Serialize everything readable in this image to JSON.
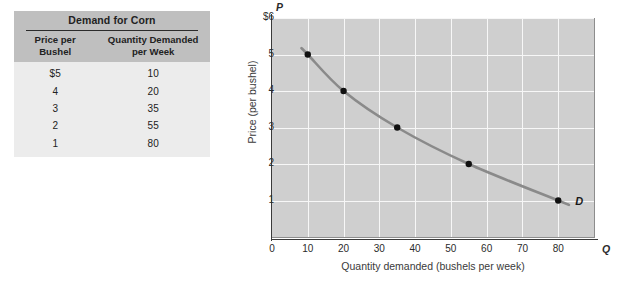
{
  "table": {
    "title": "Demand for Corn",
    "columns": [
      "Price per Bushel",
      "Quantity Demanded per Week"
    ],
    "columns_lines": [
      [
        "Price per",
        "Bushel"
      ],
      [
        "Quantity Demanded",
        "per Week"
      ]
    ],
    "rows": [
      {
        "price": "$5",
        "quantity": "10"
      },
      {
        "price": "4",
        "quantity": "20"
      },
      {
        "price": "3",
        "quantity": "35"
      },
      {
        "price": "2",
        "quantity": "55"
      },
      {
        "price": "1",
        "quantity": "80"
      }
    ],
    "header_bg": "#bfbfbf",
    "body_bg": "#ececec"
  },
  "chart_data": {
    "type": "line",
    "title": "",
    "xlabel": "Quantity demanded (bushels per week)",
    "ylabel": "Price (per bushel)",
    "x_axis_symbol": "Q",
    "y_axis_symbol": "P",
    "xlim": [
      0,
      90
    ],
    "ylim": [
      0,
      6
    ],
    "xticks": [
      "0",
      "10",
      "20",
      "30",
      "40",
      "50",
      "60",
      "70",
      "80"
    ],
    "xtick_values": [
      0,
      10,
      20,
      30,
      40,
      50,
      60,
      70,
      80
    ],
    "yticks": [
      "1",
      "2",
      "3",
      "4",
      "5",
      "$6"
    ],
    "ytick_values": [
      1,
      2,
      3,
      4,
      5,
      6
    ],
    "grid": true,
    "legend": "none",
    "series": [
      {
        "name": "D",
        "annotation": "D",
        "color": "#8a8a8a",
        "marker_color": "#111111",
        "x": [
          10,
          20,
          35,
          55,
          80
        ],
        "y": [
          5,
          4,
          3,
          2,
          1
        ],
        "points": [
          {
            "quantity": 10,
            "price": 5
          },
          {
            "quantity": 20,
            "price": 4
          },
          {
            "quantity": 35,
            "price": 3
          },
          {
            "quantity": 55,
            "price": 2
          },
          {
            "quantity": 80,
            "price": 1
          }
        ]
      }
    ],
    "plot_bg": "#cfcfcf",
    "gridline_color": "#f7f7f7"
  }
}
